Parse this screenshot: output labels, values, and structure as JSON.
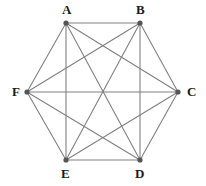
{
  "figure": {
    "type": "graph-diagram",
    "width": 206,
    "height": 186,
    "background_color": "#ffffff"
  },
  "style": {
    "edge_color": "#808080",
    "edge_width": 1.1,
    "vertex_color": "#555555",
    "vertex_radius": 2.6,
    "label_color": "#1a1a1a",
    "label_font_size": 13
  },
  "chart_data": {
    "type": "diagram",
    "graph_name": "K6",
    "vertex_count": 6,
    "edge_count": 15,
    "layout": "hexagon",
    "vertices": [
      {
        "id": "A",
        "label": "A",
        "x": 66,
        "y": 23,
        "label_x": 62,
        "label_y": 3,
        "label_position": "above"
      },
      {
        "id": "B",
        "label": "B",
        "x": 140,
        "y": 23,
        "label_x": 136,
        "label_y": 3,
        "label_position": "above"
      },
      {
        "id": "C",
        "label": "C",
        "x": 178,
        "y": 92,
        "label_x": 187,
        "label_y": 85,
        "label_position": "right"
      },
      {
        "id": "D",
        "label": "D",
        "x": 140,
        "y": 160,
        "label_x": 135,
        "label_y": 167,
        "label_position": "below"
      },
      {
        "id": "E",
        "label": "E",
        "x": 66,
        "y": 160,
        "label_x": 61,
        "label_y": 167,
        "label_position": "below"
      },
      {
        "id": "F",
        "label": "F",
        "x": 27,
        "y": 92,
        "label_x": 12,
        "label_y": 85,
        "label_position": "left"
      }
    ],
    "edges": [
      {
        "from": "A",
        "to": "B",
        "kind": "hexagon-side"
      },
      {
        "from": "B",
        "to": "C",
        "kind": "hexagon-side"
      },
      {
        "from": "C",
        "to": "D",
        "kind": "hexagon-side"
      },
      {
        "from": "D",
        "to": "E",
        "kind": "hexagon-side"
      },
      {
        "from": "E",
        "to": "F",
        "kind": "hexagon-side"
      },
      {
        "from": "F",
        "to": "A",
        "kind": "hexagon-side"
      },
      {
        "from": "A",
        "to": "C",
        "kind": "diagonal"
      },
      {
        "from": "A",
        "to": "D",
        "kind": "diagonal"
      },
      {
        "from": "A",
        "to": "E",
        "kind": "long-diagonal"
      },
      {
        "from": "B",
        "to": "D",
        "kind": "diagonal"
      },
      {
        "from": "B",
        "to": "E",
        "kind": "diagonal"
      },
      {
        "from": "B",
        "to": "F",
        "kind": "diagonal"
      },
      {
        "from": "C",
        "to": "E",
        "kind": "diagonal"
      },
      {
        "from": "C",
        "to": "F",
        "kind": "long-diagonal"
      },
      {
        "from": "D",
        "to": "F",
        "kind": "diagonal"
      }
    ]
  }
}
